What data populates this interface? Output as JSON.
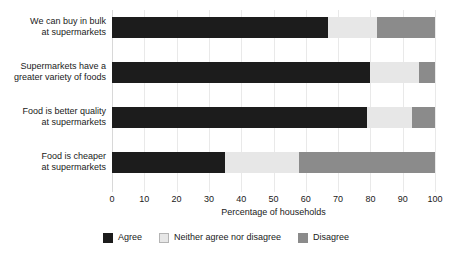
{
  "chart_data": {
    "type": "bar",
    "orientation": "horizontal",
    "stacked": true,
    "title": "",
    "xlabel": "Percentage of households",
    "ylabel": "",
    "xlim": [
      0,
      100
    ],
    "xticks": [
      0,
      10,
      20,
      30,
      40,
      50,
      60,
      70,
      80,
      90,
      100
    ],
    "xtick_labels": [
      "0",
      "10",
      "20",
      "30",
      "40",
      "50",
      "60",
      "70",
      "80",
      "90",
      "100"
    ],
    "grid": true,
    "grid_axis": "x",
    "legend_position": "bottom-center",
    "categories": [
      "We can buy in bulk at supermarkets",
      "Supermarkets have a greater variety of foods",
      "Food is better quality at supermarkets",
      "Food is cheaper at supermarkets"
    ],
    "category_lines": [
      [
        "We can buy in bulk",
        "at supermarkets"
      ],
      [
        "Supermarkets have a",
        "greater variety of foods"
      ],
      [
        "Food is better quality",
        "at supermarkets"
      ],
      [
        "Food is cheaper",
        "at supermarkets"
      ]
    ],
    "series": [
      {
        "name": "Agree",
        "color": "#1c1c1c",
        "values": [
          67,
          80,
          79,
          35
        ]
      },
      {
        "name": "Neither agree nor disagree",
        "color": "#e7e7e7",
        "values": [
          15,
          15,
          14,
          23
        ]
      },
      {
        "name": "Disagree",
        "color": "#8b8b8b",
        "values": [
          18,
          5,
          7,
          42
        ]
      }
    ]
  },
  "axis": {
    "x_title": "Percentage of households"
  },
  "legend": {
    "items": [
      {
        "label": "Agree",
        "color": "#1c1c1c"
      },
      {
        "label": "Neither agree nor disagree",
        "color": "#e7e7e7"
      },
      {
        "label": "Disagree",
        "color": "#8b8b8b"
      }
    ]
  },
  "colors": {
    "agree": "#1c1c1c",
    "neither": "#e7e7e7",
    "disagree": "#8b8b8b",
    "gridline": "#e9e9e9",
    "text": "#1a1a1a",
    "background": "#ffffff"
  }
}
